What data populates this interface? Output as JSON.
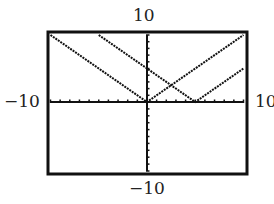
{
  "chart_data": {
    "type": "line",
    "title": "",
    "xlabel": "",
    "ylabel": "",
    "xlim": [
      -10,
      10
    ],
    "ylim": [
      -10,
      10
    ],
    "xscale": 1,
    "yscale": 1,
    "grid": false,
    "window_labels": {
      "xmin": "−10",
      "xmax": "10",
      "ymin": "−10",
      "ymax": "10"
    },
    "series": [
      {
        "name": "y = |x|",
        "x": [
          -10,
          0,
          10
        ],
        "y": [
          10,
          0,
          10
        ]
      },
      {
        "name": "y = |x − 5|",
        "x": [
          -5,
          5,
          10
        ],
        "y": [
          10,
          0,
          5
        ]
      }
    ],
    "intersection": {
      "x": 2.5,
      "y": 2.5
    }
  },
  "style": {
    "frame_color": "#111111",
    "line_color": "#111111",
    "background": "#ffffff"
  }
}
